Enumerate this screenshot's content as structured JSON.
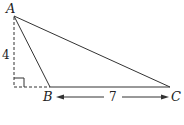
{
  "figure": {
    "type": "triangle",
    "vertices": [
      {
        "label": "A",
        "x": 14,
        "y": 16
      },
      {
        "label": "B",
        "x": 50,
        "y": 87
      },
      {
        "label": "C",
        "x": 170,
        "y": 87
      }
    ],
    "height_label": "4",
    "base_label": "7",
    "right_angle_marker": true,
    "line_color": "#333333"
  }
}
